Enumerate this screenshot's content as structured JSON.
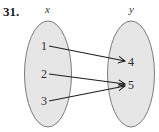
{
  "problem_number": "31.",
  "domain_set": {
    "label": "x",
    "elements": [
      "1",
      "2",
      "3"
    ]
  },
  "range_set": {
    "label": "y",
    "elements": [
      "4",
      "5"
    ]
  },
  "mappings": [
    {
      "from": "1",
      "to": "4"
    },
    {
      "from": "2",
      "to": "5"
    },
    {
      "from": "3",
      "to": "5"
    }
  ],
  "colors": {
    "ellipse_fill": "#e6e6e6",
    "ellipse_stroke": "#6e6e6e",
    "arrow": "#1f1f1f"
  }
}
